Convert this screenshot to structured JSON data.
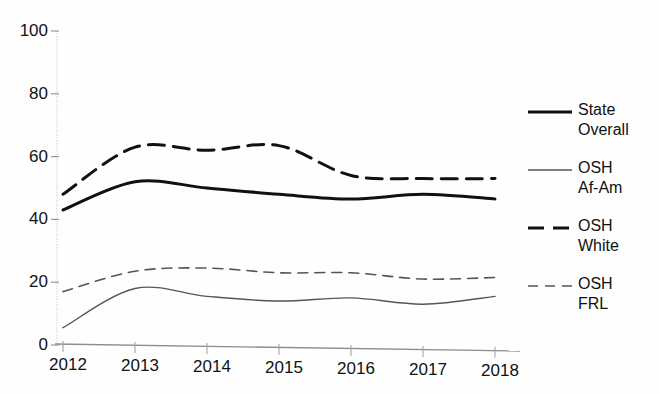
{
  "chart_data": {
    "type": "line",
    "title": "",
    "xlabel": "",
    "ylabel": "",
    "x": [
      2012,
      2013,
      2014,
      2015,
      2016,
      2017,
      2018
    ],
    "categories": [
      "2012",
      "2013",
      "2014",
      "2015",
      "2016",
      "2017",
      "2018"
    ],
    "xlim": [
      2012,
      2018
    ],
    "ylim": [
      0,
      100
    ],
    "yticks": [
      0,
      20,
      40,
      60,
      80,
      100
    ],
    "ytick_labels": [
      "0",
      "20",
      "40",
      "60",
      "80",
      "100"
    ],
    "grid": false,
    "legend_position": "right",
    "series": [
      {
        "name": "State Overall",
        "label": "State\nOverall",
        "style": "solid",
        "width": 3,
        "color": "#111111",
        "values": [
          43,
          52,
          50,
          48,
          46.5,
          48,
          46.5
        ]
      },
      {
        "name": "OSH Af-Am",
        "label": "OSH\nAf-Am",
        "style": "solid",
        "width": 1.4,
        "color": "#555555",
        "values": [
          5.5,
          18,
          15.5,
          14,
          15,
          13,
          15.5
        ]
      },
      {
        "name": "OSH White",
        "label": "OSH\nWhite",
        "style": "dashed",
        "width": 3,
        "color": "#111111",
        "values": [
          48,
          63,
          62,
          63.5,
          54,
          53,
          53
        ]
      },
      {
        "name": "OSH FRL",
        "label": "OSH\nFRL",
        "style": "dotted",
        "width": 1.6,
        "color": "#555555",
        "values": [
          17,
          23.5,
          24.5,
          23,
          23,
          21,
          21.5
        ]
      }
    ]
  }
}
